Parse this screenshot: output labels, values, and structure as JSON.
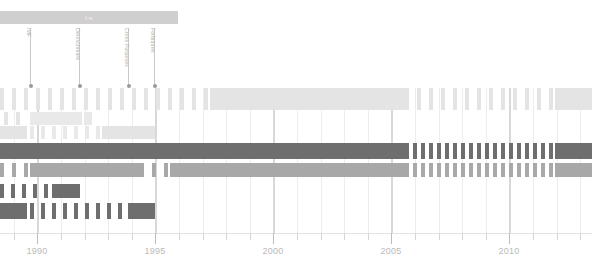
{
  "era": {
    "label": "Irs",
    "x": 0,
    "width": 178,
    "color": "#cfcfcf"
  },
  "annotations": [
    {
      "label": "IMF",
      "x": 30
    },
    {
      "label": "Deutschmark",
      "x": 79
    },
    {
      "label": "Cross Purposes",
      "x": 128
    },
    {
      "label": "Forbidden",
      "x": 154
    }
  ],
  "axis": {
    "tick_labels": [
      "1990",
      "1995",
      "2000",
      "2005",
      "2010"
    ],
    "tick_positions": [
      37,
      155,
      273,
      391,
      509
    ],
    "minor_spacing": 23.6,
    "minor_start": 14,
    "minor_count": 25
  },
  "palette": {
    "light": "#e4e4e4",
    "lighter": "#efefef",
    "medium": "#a8a8a8",
    "dark": "#6e6e6e",
    "darker": "#646464",
    "grid": "#ededed",
    "grid_major": "#d8d8d8",
    "axis_text": "#b9b9b9"
  },
  "chart_data": {
    "type": "bar",
    "title": "Irs",
    "xlabel": "",
    "ylabel": "",
    "grid": true,
    "legend": "none",
    "xlim": [
      1988.6,
      2012.0
    ],
    "x_tick_values": [
      1990,
      1995,
      2000,
      2005,
      2010
    ],
    "orientation": "horizontal-timeline",
    "rows": [
      {
        "index": 0,
        "name": "row-1",
        "top": 0,
        "height": 22,
        "segments": [
          {
            "start": 0,
            "end": 210,
            "style": "dashed",
            "color": "#e4e4e4",
            "dash": 4,
            "gap": 8
          },
          {
            "start": 210,
            "end": 405,
            "style": "solid",
            "color": "#e4e4e4"
          },
          {
            "start": 405,
            "end": 555,
            "style": "dashed",
            "color": "#e4e4e4",
            "dash": 4,
            "gap": 8
          },
          {
            "start": 555,
            "end": 592,
            "style": "solid",
            "color": "#e4e4e4"
          }
        ]
      },
      {
        "index": 1,
        "name": "row-2",
        "top": 24,
        "height": 13,
        "segments": [
          {
            "start": 4,
            "end": 28,
            "style": "dashed",
            "color": "#e4e4e4",
            "dash": 4,
            "gap": 8
          },
          {
            "start": 30,
            "end": 82,
            "style": "solid",
            "color": "#e9e9e9"
          },
          {
            "start": 84,
            "end": 92,
            "style": "solid",
            "color": "#e9e9e9"
          }
        ]
      },
      {
        "index": 2,
        "name": "row-3",
        "top": 38,
        "height": 13,
        "segments": [
          {
            "start": 0,
            "end": 27,
            "style": "solid",
            "color": "#e4e4e4"
          },
          {
            "start": 30,
            "end": 100,
            "style": "dashed",
            "color": "#e9e9e9",
            "dash": 4,
            "gap": 7
          },
          {
            "start": 102,
            "end": 155,
            "style": "solid",
            "color": "#e4e4e4"
          }
        ]
      },
      {
        "index": 3,
        "name": "row-4",
        "top": 55,
        "height": 16,
        "segments": [
          {
            "start": 0,
            "end": 405,
            "style": "solid",
            "color": "#6e6e6e"
          },
          {
            "start": 405,
            "end": 555,
            "style": "dashed",
            "color": "#6e6e6e",
            "dash": 4,
            "gap": 4
          },
          {
            "start": 555,
            "end": 592,
            "style": "solid",
            "color": "#6e6e6e"
          }
        ]
      },
      {
        "index": 4,
        "name": "row-5",
        "top": 75,
        "height": 14,
        "segments": [
          {
            "start": 0,
            "end": 28,
            "style": "dashed",
            "color": "#a8a8a8",
            "dash": 4,
            "gap": 8
          },
          {
            "start": 30,
            "end": 140,
            "style": "solid",
            "color": "#a8a8a8"
          },
          {
            "start": 140,
            "end": 170,
            "style": "dashed",
            "color": "#a8a8a8",
            "dash": 4,
            "gap": 8
          },
          {
            "start": 170,
            "end": 405,
            "style": "solid",
            "color": "#a8a8a8"
          },
          {
            "start": 405,
            "end": 555,
            "style": "dashed",
            "color": "#a8a8a8",
            "dash": 4,
            "gap": 4
          },
          {
            "start": 555,
            "end": 592,
            "style": "solid",
            "color": "#a8a8a8"
          }
        ]
      },
      {
        "index": 5,
        "name": "row-6",
        "top": 96,
        "height": 14,
        "segments": [
          {
            "start": 0,
            "end": 48,
            "style": "dashed",
            "color": "#6e6e6e",
            "dash": 4,
            "gap": 7
          },
          {
            "start": 52,
            "end": 80,
            "style": "solid",
            "color": "#6e6e6e"
          }
        ]
      },
      {
        "index": 6,
        "name": "row-7",
        "top": 115,
        "height": 16,
        "segments": [
          {
            "start": 0,
            "end": 27,
            "style": "solid",
            "color": "#6e6e6e"
          },
          {
            "start": 30,
            "end": 128,
            "style": "dashed",
            "color": "#6e6e6e",
            "dash": 4,
            "gap": 7
          },
          {
            "start": 128,
            "end": 155,
            "style": "solid",
            "color": "#6e6e6e"
          }
        ]
      }
    ]
  }
}
